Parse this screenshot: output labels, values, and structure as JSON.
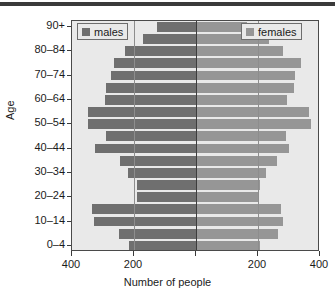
{
  "chart_data": {
    "type": "bar",
    "subtype": "population-pyramid",
    "title": "",
    "xlabel": "Number of people",
    "ylabel": "Age",
    "orientation": "horizontal",
    "grid": false,
    "legend_position": "inside-top-left and inside-top-right",
    "categories": [
      "0-4",
      "5-9",
      "10-14",
      "15-19",
      "20-24",
      "25-29",
      "30-34",
      "35-39",
      "40-44",
      "45-49",
      "50-54",
      "55-59",
      "60-64",
      "65-69",
      "70-74",
      "75-79",
      "80-84",
      "85-89",
      "90+"
    ],
    "axis_tick_values": [
      400,
      200,
      0,
      200,
      400
    ],
    "axis_tick_labels": [
      "400",
      "200",
      "",
      "200",
      "400"
    ],
    "xlim": [
      -400,
      400
    ],
    "series": [
      {
        "name": "males",
        "color": "#6f6f6f",
        "direction": "left",
        "values": [
          215,
          250,
          330,
          335,
          190,
          190,
          220,
          245,
          325,
          290,
          350,
          350,
          295,
          290,
          275,
          265,
          230,
          170,
          125
        ]
      },
      {
        "name": "females",
        "color": "#969696",
        "direction": "right",
        "values": [
          205,
          265,
          280,
          275,
          200,
          205,
          225,
          260,
          300,
          290,
          370,
          365,
          295,
          315,
          320,
          340,
          280,
          235,
          165
        ]
      }
    ],
    "labeled_categories": [
      "90+",
      "80-84",
      "70-74",
      "60-64",
      "50-54",
      "40-44",
      "30-34",
      "20-24",
      "10-14",
      "0-4"
    ]
  },
  "legend": {
    "males_label": "males",
    "females_label": "females"
  },
  "axes": {
    "y_title": "Age",
    "x_title": "Number of people"
  },
  "colors": {
    "male_bar": "#6f6f6f",
    "female_bar": "#969696",
    "plot_background": "#e9e9e9",
    "frame": "#4a4a4a",
    "zero_line": "#3d3d3d",
    "gridline": "#8d8d8d",
    "text": "#1b1b1b",
    "top_rule": "#3a3a3a"
  }
}
